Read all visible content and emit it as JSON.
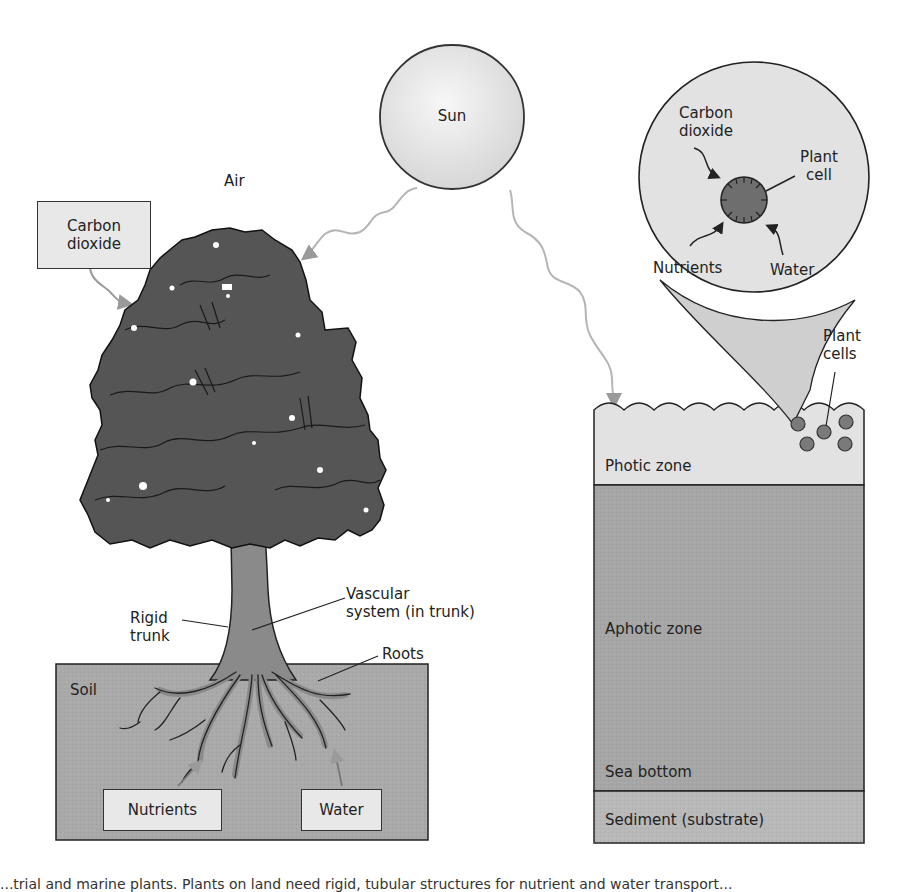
{
  "diagram": {
    "type": "photosynthesis-comparison",
    "colors": {
      "background": "#ffffff",
      "sun_fill": "#e6e6e6",
      "light_ray": "#b5b5b5",
      "tree_crown": "#555555",
      "trunk": "#8a8a8a",
      "soil": "#a9a9a9",
      "label_box": "#e8e8e8",
      "photic_zone": "#e2e2e2",
      "aphotic_zone": "#a6a6a6",
      "sediment": "#b8b8b8",
      "plant_cell": "#7a7a7a",
      "magnifier": "#e2e2e2"
    },
    "sun": {
      "label": "Sun"
    },
    "land": {
      "air_label": "Air",
      "carbon_dioxide_box": "Carbon\ndioxide",
      "rigid_trunk_label": "Rigid\ntrunk",
      "vascular_label": "Vascular\nsystem (in trunk)",
      "roots_label": "Roots",
      "soil_label": "Soil",
      "nutrients_box": "Nutrients",
      "water_box": "Water"
    },
    "ocean": {
      "magnifier": {
        "carbon_dioxide_label": "Carbon\ndioxide",
        "plant_cell_label": "Plant\ncell",
        "nutrients_label": "Nutrients",
        "water_label": "Water"
      },
      "plant_cells_label": "Plant\ncells",
      "zones": [
        {
          "label": "Photic zone"
        },
        {
          "label": "Aphotic zone"
        },
        {
          "label": "Sea bottom"
        },
        {
          "label": "Sediment (substrate)"
        }
      ]
    },
    "caption": "...trial and marine plants. Plants on land need rigid, tubular structures for nutrient and water transport..."
  }
}
